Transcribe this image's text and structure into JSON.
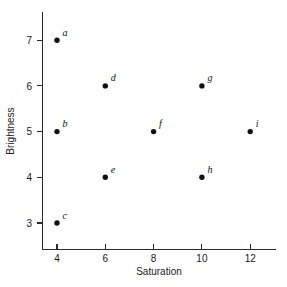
{
  "chart_data": {
    "type": "scatter",
    "title": "",
    "xlabel": "Saturation",
    "ylabel": "Brightness",
    "xlim": [
      2.6,
      13.2
    ],
    "ylim": [
      2.3,
      7.6
    ],
    "xticks": [
      4,
      6,
      8,
      10,
      12
    ],
    "yticks": [
      3,
      4,
      5,
      6,
      7
    ],
    "xtick_labels": [
      "4",
      "6",
      "8",
      "10",
      "12"
    ],
    "ytick_labels": [
      "3",
      "4",
      "5",
      "6",
      "7"
    ],
    "grid": false,
    "legend": false,
    "marker": "filled-circle",
    "marker_color": "#111111",
    "points": [
      {
        "label": "a",
        "x": 4,
        "y": 7
      },
      {
        "label": "b",
        "x": 4,
        "y": 5
      },
      {
        "label": "c",
        "x": 4,
        "y": 3
      },
      {
        "label": "d",
        "x": 6,
        "y": 6
      },
      {
        "label": "e",
        "x": 6,
        "y": 4
      },
      {
        "label": "f",
        "x": 8,
        "y": 5
      },
      {
        "label": "g",
        "x": 10,
        "y": 6
      },
      {
        "label": "h",
        "x": 10,
        "y": 4
      },
      {
        "label": "i",
        "x": 12,
        "y": 5
      }
    ]
  },
  "axes": {
    "x_title": "Saturation",
    "y_title": "Brightness"
  }
}
